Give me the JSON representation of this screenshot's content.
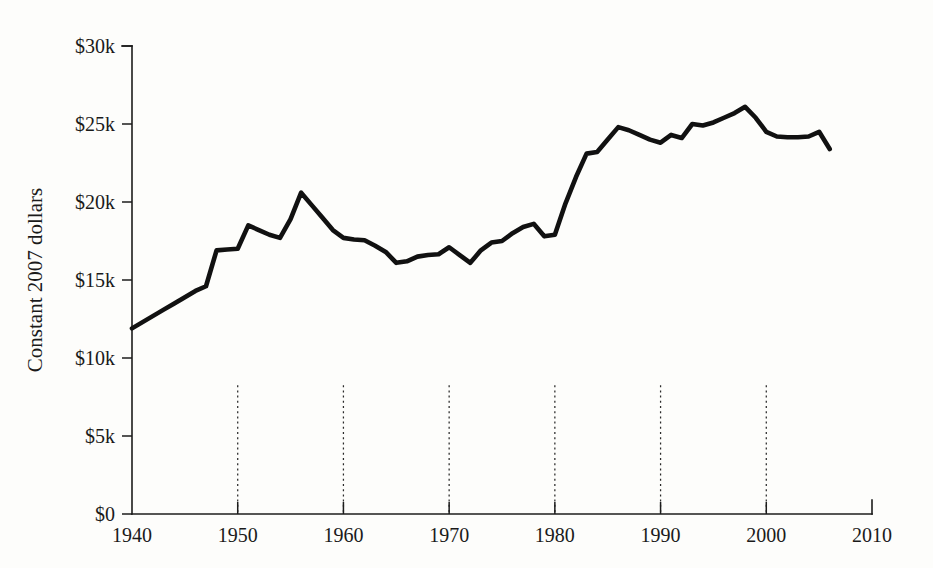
{
  "chart_data": {
    "type": "line",
    "title": "",
    "subtitle": "",
    "xlabel": "",
    "ylabel": "Constant 2007 dollars",
    "xlim": [
      1940,
      2010
    ],
    "ylim": [
      0,
      30000
    ],
    "grid": "vertical dotted gridlines at each labeled decade from 1950 to 2000",
    "legend": "none",
    "legend_position": "none",
    "line_color": "#111111",
    "y_tick_labels": [
      "$0",
      "$5k",
      "$10k",
      "$15k",
      "$20k",
      "$25k",
      "$30k"
    ],
    "y_tick_values": [
      0,
      5000,
      10000,
      15000,
      20000,
      25000,
      30000
    ],
    "x_tick_labels": [
      "1940",
      "1950",
      "1960",
      "1970",
      "1980",
      "1990",
      "2000",
      "2010"
    ],
    "x_tick_values": [
      1940,
      1950,
      1960,
      1970,
      1980,
      1990,
      2000,
      2010
    ],
    "gridline_years": [
      1950,
      1960,
      1970,
      1980,
      1990,
      2000
    ],
    "series": [
      {
        "name": "Constant 2007 dollars",
        "x": [
          1940,
          1941,
          1942,
          1943,
          1944,
          1945,
          1946,
          1947,
          1948,
          1949,
          1950,
          1951,
          1952,
          1953,
          1954,
          1955,
          1956,
          1957,
          1958,
          1959,
          1960,
          1961,
          1962,
          1963,
          1964,
          1965,
          1966,
          1967,
          1968,
          1969,
          1970,
          1971,
          1972,
          1973,
          1974,
          1975,
          1976,
          1977,
          1978,
          1979,
          1980,
          1981,
          1982,
          1983,
          1984,
          1985,
          1986,
          1987,
          1988,
          1989,
          1990,
          1991,
          1992,
          1993,
          1994,
          1995,
          1996,
          1997,
          1998,
          1999,
          2000,
          2001,
          2002,
          2003,
          2004,
          2005,
          2006
        ],
        "values": [
          11900,
          12300,
          12700,
          13100,
          13500,
          13900,
          14300,
          14600,
          16900,
          16950,
          17000,
          18500,
          18200,
          17900,
          17700,
          18900,
          20600,
          19800,
          19000,
          18200,
          17700,
          17600,
          17550,
          17200,
          16800,
          16100,
          16200,
          16500,
          16600,
          16650,
          17100,
          16600,
          16100,
          16900,
          17400,
          17500,
          18000,
          18400,
          18600,
          17800,
          17900,
          19900,
          21600,
          23100,
          23200,
          24000,
          24800,
          24600,
          24300,
          24000,
          23800,
          24300,
          24100,
          25000,
          24900,
          25100,
          25400,
          25700,
          26100,
          25400,
          24500,
          24200,
          24150,
          24150,
          24200,
          24500,
          23400
        ]
      }
    ]
  }
}
